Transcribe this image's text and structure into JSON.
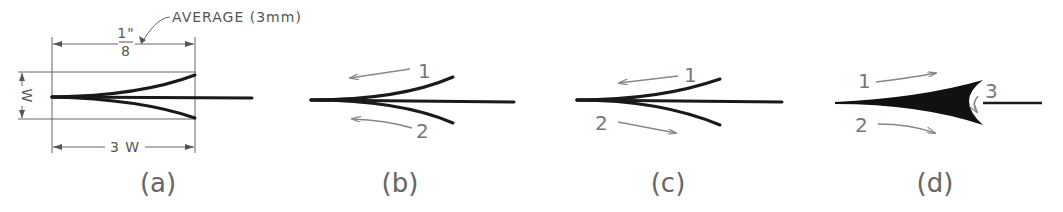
{
  "figure": {
    "panels": [
      {
        "id": "a",
        "label": "(a)",
        "annotation": "AVERAGE (3mm)",
        "dim_top_num": "1\"",
        "dim_top_den": "8",
        "dim_side": "W",
        "dim_bottom": "3 W"
      },
      {
        "id": "b",
        "label": "(b)",
        "arrow_labels": [
          "1",
          "2"
        ]
      },
      {
        "id": "c",
        "label": "(c)",
        "arrow_labels": [
          "1",
          "2"
        ]
      },
      {
        "id": "d",
        "label": "(d)",
        "arrow_labels": [
          "1",
          "2",
          "3"
        ]
      }
    ]
  }
}
